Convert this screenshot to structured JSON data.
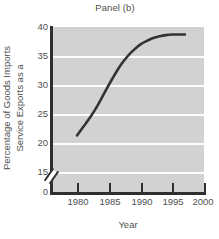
{
  "chart_data": {
    "type": "line",
    "title": "Panel (b)",
    "xlabel": "Year",
    "ylabel": "Service Exports as a Percentage of Goods Imports",
    "ylabel_line1": "Service Exports as a",
    "ylabel_line2": "Percentage of Goods Imports",
    "xlim": [
      1976,
      2000
    ],
    "ylim": [
      15,
      40
    ],
    "y_axis_break": true,
    "y_axis_break_symbol": "//",
    "grid": true,
    "grid_orientation": "horizontal",
    "legend": "none",
    "xticks": [
      "1980",
      "1985",
      "1990",
      "1995",
      "2000"
    ],
    "xtick_values": [
      1980,
      1985,
      1990,
      1995,
      2000
    ],
    "yticks": [
      "40",
      "35",
      "30",
      "25",
      "20",
      "15",
      "0"
    ],
    "ytick_values": [
      40,
      35,
      30,
      25,
      20,
      15,
      0
    ],
    "series": [
      {
        "name": "Service Exports as a Percentage of Goods Imports",
        "color": "#333333",
        "x": [
          1980,
          1981,
          1982,
          1983,
          1984,
          1985,
          1986,
          1987,
          1988,
          1989,
          1990,
          1991,
          1992,
          1993,
          1994,
          1995,
          1996,
          1997
        ],
        "values": [
          21.3,
          22.8,
          24.3,
          26.0,
          28.0,
          30.0,
          31.9,
          33.6,
          35.0,
          36.1,
          37.0,
          37.6,
          38.1,
          38.4,
          38.6,
          38.7,
          38.7,
          38.7
        ]
      }
    ],
    "annotations": [],
    "colors": {
      "plot_background": "#d2d2d2",
      "gridline": "#fdfdfd",
      "axis": "#2f2f2f",
      "line": "#333333",
      "text": "#4f4f4f",
      "page_background": "#ffffff"
    }
  }
}
